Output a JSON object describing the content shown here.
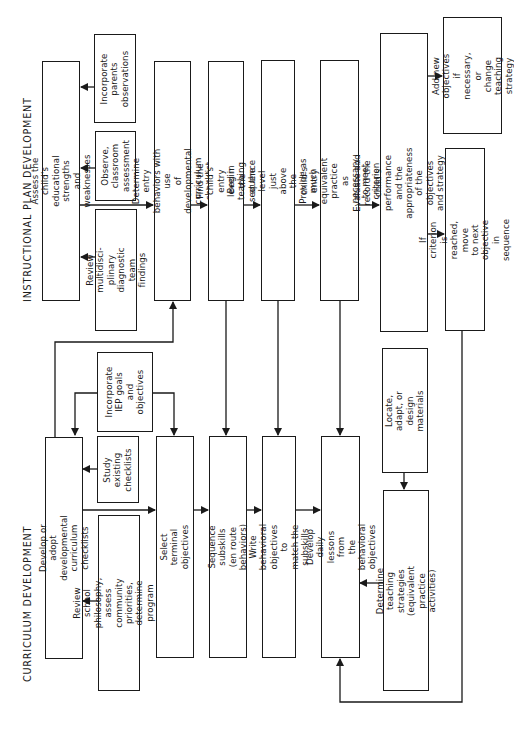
{
  "diagram": {
    "orientation": "rotated 90 degrees counter-clockwise",
    "sections": {
      "instructional": "INSTRUCTIONAL  PLAN  DEVELOPMENT",
      "curriculum": "CURRICULUM  DEVELOPMENT"
    },
    "nodes": {
      "assess": "Assess the child's educational\nstrengths and weaknesses",
      "parents": "Incorporate\nparents\nobservations",
      "observe": "Observe,\nclassroom\nassessment",
      "review_team": "Review multidisci-\nplinary diagnostic\nteam findings",
      "entry_behaviors": "Determine entry behaviors with use\nof developmental curriculum checklist",
      "entry_level": "Find the child's entry\nlevel in the sequence",
      "begin_teaching": "Begin teaching at the level just\nabove the child's entry level",
      "practice": "Provide as much equivalent practice\nas necessary to meet criterion",
      "evaluate": "Evaluate and record the child's performance\nand the appropriateness of the objectives\nand strategy continuously",
      "add_objectives": "Add new objectives\nif necessary, or\nchange teaching\nstrategy",
      "criterion": "If criterion is reached, move\nto next objective in sequence",
      "develop_checklists": "Develop or adopt developmental\ncurriculum checklists",
      "iep": "Incorporate\nIEP goals\nand\nobjectives",
      "study": "Study\nexisting\nchecklists",
      "philosophy": "Review school philosophy,\nassess community priorities,\ndetermine program goals",
      "terminal": "Select terminal objectives",
      "subskills": "Sequence subskills\n(en route behaviors)",
      "write_objectives": "Write behavioral objectives to\nmatch the subskills",
      "daily_lessons": "Develop daily lessons from\nthe behavioral objectives",
      "materials": "Locate, adapt, or\ndesign materials",
      "strategies": "Determine teaching strategies\n(equivalent practice activities)"
    },
    "colors": {
      "line": "#1a1a1a",
      "background": "#ffffff"
    }
  }
}
